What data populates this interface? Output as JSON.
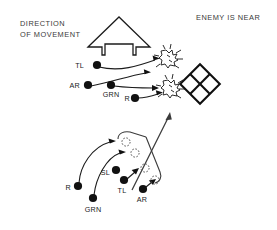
{
  "figure": {
    "background_color": "#ffffff",
    "ink_color": "#1c1c1c",
    "text_color": "#2b2b2b",
    "width": 277,
    "height": 230
  },
  "annotations": {
    "direction_line1": "DIRECTION",
    "direction_line2": "OF MOVEMENT",
    "enemy_status": "ENEMY IS NEAR"
  },
  "icons": {
    "movement_arrow": "up-arrow-outline-icon",
    "enemy_burst": "enemy-burst-icon",
    "objective_grid": "diamond-grid-icon",
    "transition_arrow": "diagonal-arrow-icon"
  },
  "upper_panel": {
    "name": "assault-formation-panel",
    "units": [
      {
        "label": "TL",
        "x": 97,
        "y": 65,
        "label_x": 86,
        "label_y": 68
      },
      {
        "label": "AR",
        "x": 88,
        "y": 85,
        "label_x": 74,
        "label_y": 88
      },
      {
        "label": "GRN",
        "x": 111,
        "y": 85,
        "label_x": 95,
        "label_y": 95
      },
      {
        "label": "R",
        "x": 135,
        "y": 98,
        "label_x": 126,
        "label_y": 101
      }
    ],
    "enemy_positions": [
      {
        "name": "enemy-north",
        "x": 168,
        "y": 58
      },
      {
        "name": "enemy-south",
        "x": 170,
        "y": 88
      }
    ],
    "objective": {
      "name": "objective-building",
      "x": 200,
      "y": 84
    }
  },
  "lower_panel": {
    "name": "approach-formation-panel",
    "units": [
      {
        "label": "R",
        "x": 78,
        "y": 186,
        "label_x": 68,
        "label_y": 189
      },
      {
        "label": "GRN",
        "x": 93,
        "y": 198,
        "label_x": 83,
        "label_y": 211
      },
      {
        "label": "SL",
        "x": 116,
        "y": 170,
        "label_x": 103,
        "label_y": 184
      },
      {
        "label": "TL",
        "x": 124,
        "y": 180,
        "label_x": 113,
        "label_y": 192
      },
      {
        "label": "AR",
        "x": 143,
        "y": 189,
        "label_x": 135,
        "label_y": 201
      }
    ],
    "target_slots": [
      {
        "name": "slot-1",
        "x": 126,
        "y": 142
      },
      {
        "name": "slot-2",
        "x": 135,
        "y": 153
      },
      {
        "name": "slot-3",
        "x": 145,
        "y": 168
      },
      {
        "name": "slot-4",
        "x": 155,
        "y": 180
      }
    ]
  }
}
